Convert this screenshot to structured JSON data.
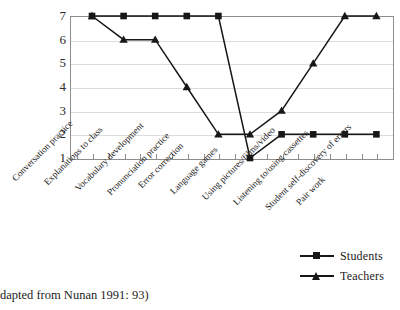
{
  "chart_data": {
    "type": "line",
    "title": "",
    "subtitle": "",
    "xlabel": "",
    "ylabel": "",
    "ylim": [
      1,
      7
    ],
    "yticks": [
      1,
      2,
      3,
      4,
      5,
      6,
      7
    ],
    "grid": true,
    "legend_position": "bottom-right",
    "categories": [
      "Conversation practice",
      "Explanations to class",
      "Vocabulary development",
      "Pronunciation practice",
      "Error correction",
      "Language games",
      "Using pictures/films/video",
      "Listening to/using cassettes",
      "Student self-discovery of errors",
      "Pair work"
    ],
    "series": [
      {
        "name": "Students",
        "marker": "square",
        "color": "#171717",
        "values": [
          7,
          7,
          7,
          7,
          7,
          1,
          2,
          2,
          2,
          2
        ]
      },
      {
        "name": "Teachers",
        "marker": "triangle",
        "color": "#171717",
        "values": [
          7,
          6,
          6,
          4,
          2,
          2,
          3,
          5,
          7,
          7
        ]
      }
    ]
  },
  "legend": {
    "items": [
      {
        "label": "Students",
        "marker": "square"
      },
      {
        "label": "Teachers",
        "marker": "triangle"
      }
    ]
  },
  "caption": {
    "text": "dapted from Nunan 1991: 93)"
  },
  "colors": {
    "series": "#171717",
    "grid": "#dcdcdc",
    "axis": "#8d8d8d",
    "background": "#ffffff",
    "text": "#1a1a1a"
  }
}
